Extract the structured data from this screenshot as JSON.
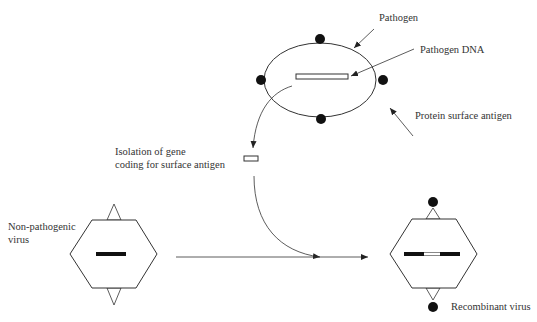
{
  "labels": {
    "pathogen": "Pathogen",
    "pathogen_dna": "Pathogen DNA",
    "protein_surface_antigen": "Protein surface antigen",
    "isolation_line1": "Isolation of gene",
    "isolation_line2": "coding for surface antigen",
    "non_pathogenic_line1": "Non-pathogenic",
    "non_pathogenic_line2": "virus",
    "recombinant_virus": "Recombinant virus"
  },
  "colors": {
    "stroke": "#333333",
    "fill_dark": "#111111",
    "background": "#ffffff"
  }
}
